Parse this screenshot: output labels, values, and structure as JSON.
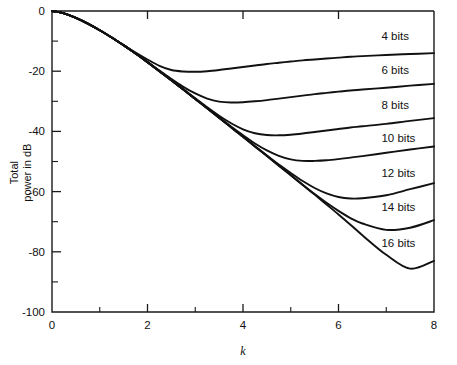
{
  "chart_data": {
    "type": "line",
    "title": "",
    "xlabel": "k",
    "ylabel_line1": "Total",
    "ylabel_line2": "power in dB",
    "xlim": [
      0,
      8
    ],
    "ylim": [
      -100,
      0
    ],
    "grid": false,
    "legend_position": "inline-right",
    "x_ticks_major": [
      0,
      2,
      4,
      6,
      8
    ],
    "x_ticks_major_labels": [
      "0",
      "2",
      "4",
      "6",
      "8"
    ],
    "x_ticks_minor": [
      1,
      3,
      5,
      7
    ],
    "y_ticks_major": [
      0,
      -20,
      -40,
      -60,
      -80,
      -100
    ],
    "y_ticks_major_labels": [
      "0",
      "-20",
      "-40",
      "-60",
      "-80",
      "-100"
    ],
    "y_ticks_minor": [
      -10,
      -30,
      -50,
      -70,
      -90
    ],
    "x": [
      0,
      0.25,
      0.5,
      0.75,
      1,
      1.25,
      1.5,
      1.75,
      2,
      2.25,
      2.5,
      2.75,
      3,
      3.25,
      3.5,
      3.75,
      4,
      4.25,
      4.5,
      4.75,
      5,
      5.25,
      5.5,
      5.75,
      6,
      6.25,
      6.5,
      7,
      7.5,
      8
    ],
    "series": [
      {
        "name": "4 bits",
        "label": "4 bits",
        "label_x": 6.9,
        "label_y": -9.5,
        "min_value": -20.2,
        "min_at_k": 2.5,
        "end_value": -14.0,
        "values": [
          0,
          -0.8,
          -2.3,
          -4.2,
          -6.4,
          -8.8,
          -11.3,
          -13.8,
          -16.1,
          -18.2,
          -19.6,
          -20.1,
          -20.2,
          -20.0,
          -19.6,
          -19.1,
          -18.6,
          -18.1,
          -17.6,
          -17.2,
          -16.8,
          -16.4,
          -16.1,
          -15.8,
          -15.5,
          -15.2,
          -15.0,
          -14.6,
          -14.3,
          -14.0
        ]
      },
      {
        "name": "6 bits",
        "label": "6 bits",
        "label_x": 6.9,
        "label_y": -21.0,
        "min_value": -30.4,
        "min_at_k": 3.2,
        "end_value": -24.2,
        "values": [
          0,
          -0.8,
          -2.3,
          -4.2,
          -6.4,
          -8.8,
          -11.4,
          -14.1,
          -16.9,
          -19.8,
          -22.6,
          -25.2,
          -27.4,
          -29.1,
          -30.1,
          -30.4,
          -30.3,
          -30.0,
          -29.6,
          -29.1,
          -28.6,
          -28.1,
          -27.6,
          -27.2,
          -26.8,
          -26.4,
          -26.1,
          -25.5,
          -24.8,
          -24.2
        ]
      },
      {
        "name": "8 bits",
        "label": "8 bits",
        "label_x": 6.9,
        "label_y": -32.5,
        "min_value": -41.3,
        "min_at_k": 3.8,
        "end_value": -35.6,
        "values": [
          0,
          -0.8,
          -2.3,
          -4.2,
          -6.4,
          -8.8,
          -11.4,
          -14.1,
          -17.0,
          -20.0,
          -23.0,
          -26.0,
          -29.0,
          -32.0,
          -34.8,
          -37.3,
          -39.3,
          -40.6,
          -41.2,
          -41.3,
          -41.1,
          -40.7,
          -40.2,
          -39.7,
          -39.2,
          -38.7,
          -38.3,
          -37.5,
          -36.5,
          -35.6
        ]
      },
      {
        "name": "10 bits",
        "label": "10 bits",
        "label_x": 6.9,
        "label_y": -43.5,
        "min_value": -49.8,
        "min_at_k": 4.3,
        "end_value": -45.0,
        "values": [
          0,
          -0.8,
          -2.3,
          -4.2,
          -6.4,
          -8.8,
          -11.4,
          -14.1,
          -17.0,
          -20.0,
          -23.0,
          -26.1,
          -29.2,
          -32.3,
          -35.4,
          -38.4,
          -41.3,
          -44.0,
          -46.3,
          -48.1,
          -49.3,
          -49.8,
          -49.8,
          -49.6,
          -49.2,
          -48.7,
          -48.2,
          -47.1,
          -46.0,
          -45.0
        ]
      },
      {
        "name": "12 bits",
        "label": "12 bits",
        "label_x": 6.9,
        "label_y": -55.0,
        "min_value": -62.3,
        "min_at_k": 4.8,
        "end_value": -57.2,
        "values": [
          0,
          -0.8,
          -2.3,
          -4.2,
          -6.4,
          -8.8,
          -11.4,
          -14.1,
          -17.0,
          -20.0,
          -23.0,
          -26.1,
          -29.2,
          -32.3,
          -35.5,
          -38.6,
          -41.8,
          -44.9,
          -48.0,
          -51.0,
          -53.8,
          -56.5,
          -58.8,
          -60.6,
          -61.8,
          -62.3,
          -62.2,
          -61.2,
          -59.2,
          -57.2
        ]
      },
      {
        "name": "14 bits",
        "label": "14 bits",
        "label_x": 6.9,
        "label_y": -66.5,
        "min_value": -73.2,
        "min_at_k": 5.4,
        "end_value": -69.5,
        "values": [
          0,
          -0.8,
          -2.3,
          -4.2,
          -6.4,
          -8.8,
          -11.4,
          -14.1,
          -17.0,
          -20.0,
          -23.0,
          -26.1,
          -29.2,
          -32.3,
          -35.5,
          -38.6,
          -41.8,
          -45.0,
          -48.1,
          -51.3,
          -54.5,
          -57.7,
          -60.8,
          -63.7,
          -66.4,
          -68.8,
          -70.6,
          -72.7,
          -72.0,
          -69.5
        ]
      },
      {
        "name": "16 bits",
        "label": "16 bits",
        "label_x": 6.9,
        "label_y": -78.5,
        "min_value": -86.2,
        "min_at_k": 6.2,
        "end_value": -83.0,
        "values": [
          0,
          -0.8,
          -2.3,
          -4.2,
          -6.4,
          -8.8,
          -11.4,
          -14.1,
          -17.0,
          -20.0,
          -23.0,
          -26.1,
          -29.2,
          -32.3,
          -35.5,
          -38.6,
          -41.8,
          -45.0,
          -48.2,
          -51.4,
          -54.6,
          -57.8,
          -61.0,
          -64.3,
          -67.6,
          -71.0,
          -74.5,
          -81.0,
          -85.6,
          -83.0
        ]
      }
    ]
  }
}
